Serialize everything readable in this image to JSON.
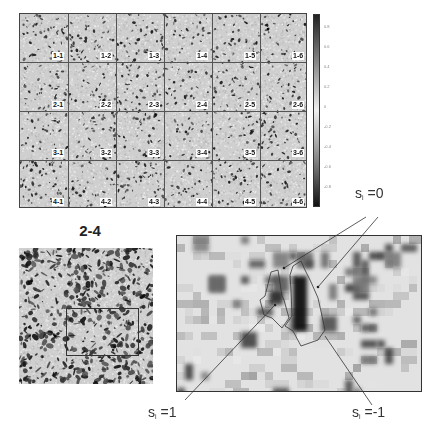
{
  "figure": {
    "grid_panel": {
      "rows": 4,
      "cols": 6,
      "cell_labels": [
        [
          "1-1",
          "1-2",
          "1-3",
          "1-4",
          "1-5",
          "1-6"
        ],
        [
          "2-1",
          "2-2",
          "2-3",
          "2-4",
          "2-5",
          "2-6"
        ],
        [
          "3-1",
          "3-2",
          "3-3",
          "3-4",
          "3-5",
          "3-6"
        ],
        [
          "4-1",
          "4-2",
          "4-3",
          "4-4",
          "4-5",
          "4-6"
        ]
      ]
    },
    "colorbar": {
      "ticks": [
        "0.8",
        "0.6",
        "0.4",
        "0.2",
        "0",
        "-0.2",
        "-0.4",
        "-0.6",
        "-0.8"
      ],
      "top_color": "#222222",
      "mid_color": "#f0f0f0",
      "bottom_color": "#111111"
    },
    "zoom_panel": {
      "title": "2-4"
    },
    "detail_panel": {
      "annotations": {
        "s0": {
          "symbol": "s",
          "subscript": "i",
          "value": " =0"
        },
        "s1": {
          "symbol": "s",
          "subscript": "i",
          "value": " =1"
        },
        "sm1": {
          "symbol": "s",
          "subscript": "i",
          "value": " =-1"
        }
      }
    }
  }
}
